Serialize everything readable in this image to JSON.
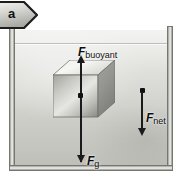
{
  "figure": {
    "panel_label": "a",
    "panel_tag_icon": "pentagon-tag"
  },
  "tank": {
    "name": "fluid-container",
    "wall_color": "#9a9a96",
    "fluid_color_top": "#f1f1ef",
    "fluid_color_bottom": "#bfbfba"
  },
  "object": {
    "name": "cube",
    "top_face_color": "#eeeeea",
    "front_face_color": "#d0d0cb",
    "side_face_color": "#99999 5"
  },
  "forces": [
    {
      "id": "buoyant",
      "symbol": "F",
      "subscript": "buoyant",
      "direction": "up",
      "color": "#1b1b1b"
    },
    {
      "id": "net",
      "symbol": "F",
      "subscript": "net",
      "direction": "down",
      "color": "#1b1b1b"
    },
    {
      "id": "gravity",
      "symbol": "F",
      "subscript": "g",
      "direction": "down",
      "color": "#1b1b1b"
    }
  ]
}
